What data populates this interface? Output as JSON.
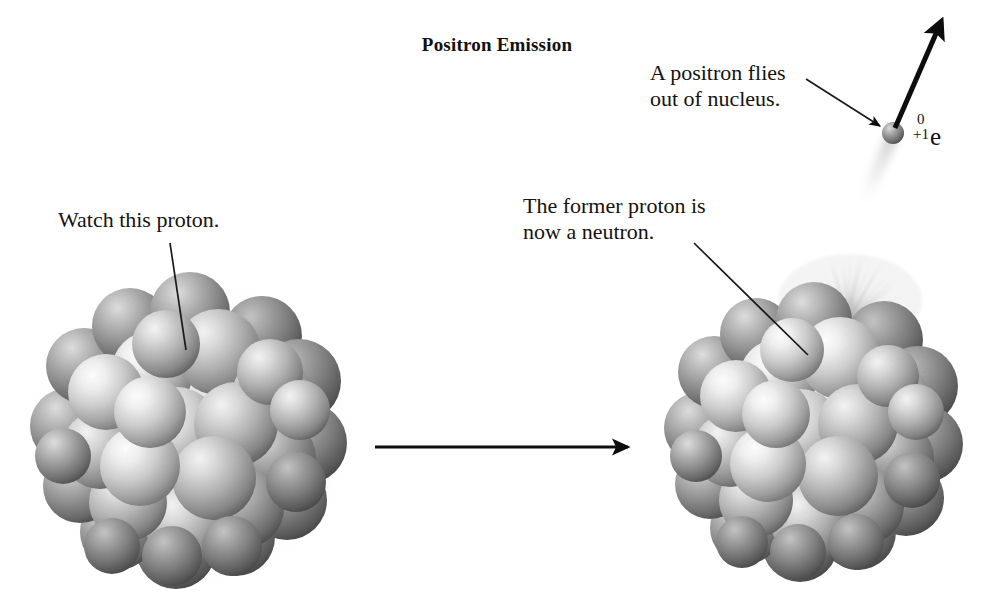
{
  "figure": {
    "title": "Positron Emission",
    "background_color": "#ffffff",
    "ink_color": "#111111"
  },
  "annotations": {
    "watch_proton": "Watch this proton.",
    "former_proton": "The former proton is\nnow a neutron.",
    "positron_flies": "A positron flies\nout of nucleus."
  },
  "particle": {
    "mass_number": "0",
    "charge": "+1",
    "symbol": "e",
    "name": "positron"
  },
  "nuclei": {
    "left": {
      "label": "parent-nucleus",
      "center_x": 190,
      "center_y": 435,
      "radius": 130,
      "nucleon_count": 38,
      "halo_color": "#ececec",
      "sphere_light": "#ffffff",
      "sphere_mid": "#b4b4b4",
      "sphere_dark": "#5f5f5f"
    },
    "right": {
      "label": "daughter-nucleus",
      "center_x": 818,
      "center_y": 432,
      "radius": 122,
      "nucleon_count": 38,
      "halo_color": "#f0f0f0",
      "sphere_light": "#ffffff",
      "sphere_mid": "#b4b4b4",
      "sphere_dark": "#5f5f5f",
      "burst": {
        "label": "emission-burst",
        "origin_x": 845,
        "origin_y": 318,
        "ray_count": 34,
        "color": "#9a9a9a"
      }
    }
  },
  "reaction_arrow": {
    "label": "yields",
    "x1": 375,
    "y1": 447,
    "x2": 628,
    "y2": 447,
    "color": "#0d0d0d"
  },
  "positron_particle": {
    "center_x": 893,
    "center_y": 133,
    "radius": 11,
    "trail_color": "#d2d2d2"
  },
  "trajectory_arrow": {
    "label": "positron-path",
    "x1": 895,
    "y1": 128,
    "x2": 941,
    "y2": 22,
    "color": "#0d0d0d",
    "width": 5
  },
  "leader_lines": [
    {
      "label": "leader-watch-proton",
      "x1": 170,
      "y1": 243,
      "x2": 186,
      "y2": 350,
      "arrow": false
    },
    {
      "label": "leader-former-proton",
      "x1": 694,
      "y1": 243,
      "x2": 808,
      "y2": 355,
      "arrow": false
    },
    {
      "label": "leader-positron-flies",
      "x1": 806,
      "y1": 79,
      "x2": 880,
      "y2": 126,
      "arrow": true
    }
  ]
}
